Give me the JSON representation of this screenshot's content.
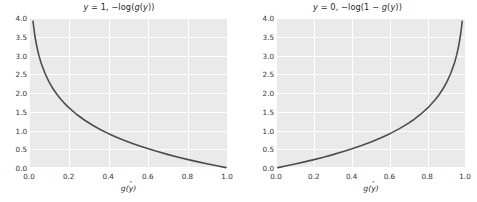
{
  "figure": {
    "width": 477,
    "height": 202,
    "background_color": "#ffffff",
    "axes_facecolor": "#eaeaea",
    "grid_color": "#ffffff",
    "curve_color": "#4d4d4d",
    "tick_color": "#333333",
    "style": "seaborn-darkgrid"
  },
  "panels": [
    {
      "id": "left",
      "title_prefix": "y",
      "title_eq": " = 1,  −log(",
      "title_fn": "g",
      "title_var": "y",
      "title_suffix": "))",
      "title_plain": "y = 1,  −log(g(ŷ))",
      "xlabel_fn": "g",
      "xlabel_var": "y",
      "xlabel_plain": "g(ŷ)",
      "xticks": [
        "0.0",
        "0.2",
        "0.4",
        "0.6",
        "0.8",
        "1.0"
      ],
      "xtick_values": [
        0.0,
        0.2,
        0.4,
        0.6,
        0.8,
        1.0
      ],
      "yticks": [
        "0.0",
        "0.5",
        "1.0",
        "1.5",
        "2.0",
        "2.5",
        "3.0",
        "3.5",
        "4.0"
      ],
      "ytick_values": [
        0.0,
        0.5,
        1.0,
        1.5,
        2.0,
        2.5,
        3.0,
        3.5,
        4.0
      ]
    },
    {
      "id": "right",
      "title_prefix": "y",
      "title_eq": " = 0,  −log(1 − ",
      "title_fn": "g",
      "title_var": "y",
      "title_suffix": "))",
      "title_plain": "y = 0,  −log(1 − g(ŷ))",
      "xlabel_fn": "g",
      "xlabel_var": "y",
      "xlabel_plain": "g(ŷ)",
      "xticks": [
        "0.0",
        "0.2",
        "0.4",
        "0.6",
        "0.8",
        "1.0"
      ],
      "xtick_values": [
        0.0,
        0.2,
        0.4,
        0.6,
        0.8,
        1.0
      ],
      "yticks": [
        "0.0",
        "0.5",
        "1.0",
        "1.5",
        "2.0",
        "2.5",
        "3.0",
        "3.5",
        "4.0"
      ],
      "ytick_values": [
        0.0,
        0.5,
        1.0,
        1.5,
        2.0,
        2.5,
        3.0,
        3.5,
        4.0
      ]
    }
  ],
  "chart_data": [
    {
      "type": "line",
      "title": "y = 1,  −log(g(ŷ))",
      "xlabel": "g(ŷ)",
      "ylabel": "",
      "xlim": [
        0.0,
        1.0
      ],
      "ylim": [
        0.0,
        4.0
      ],
      "grid": true,
      "legend": "none",
      "series": [
        {
          "name": "-log(g(yhat))",
          "x": [
            0.02,
            0.03,
            0.04,
            0.05,
            0.06,
            0.08,
            0.1,
            0.12,
            0.14,
            0.16,
            0.18,
            0.2,
            0.24,
            0.28,
            0.32,
            0.36,
            0.4,
            0.44,
            0.48,
            0.52,
            0.56,
            0.6,
            0.65,
            0.7,
            0.75,
            0.8,
            0.85,
            0.9,
            0.95,
            0.99
          ],
          "y": [
            3.912,
            3.507,
            3.219,
            2.996,
            2.813,
            2.526,
            2.303,
            2.12,
            1.966,
            1.833,
            1.715,
            1.609,
            1.427,
            1.273,
            1.139,
            1.022,
            0.916,
            0.821,
            0.734,
            0.654,
            0.58,
            0.511,
            0.431,
            0.357,
            0.288,
            0.223,
            0.163,
            0.105,
            0.051,
            0.01
          ]
        }
      ]
    },
    {
      "type": "line",
      "title": "y = 0,  −log(1 − g(ŷ))",
      "xlabel": "g(ŷ)",
      "ylabel": "",
      "xlim": [
        0.0,
        1.0
      ],
      "ylim": [
        0.0,
        4.0
      ],
      "grid": true,
      "legend": "none",
      "series": [
        {
          "name": "-log(1-g(yhat))",
          "x": [
            0.01,
            0.05,
            0.1,
            0.15,
            0.2,
            0.25,
            0.3,
            0.35,
            0.4,
            0.45,
            0.5,
            0.55,
            0.6,
            0.65,
            0.7,
            0.72,
            0.76,
            0.8,
            0.84,
            0.86,
            0.88,
            0.9,
            0.92,
            0.94,
            0.95,
            0.96,
            0.97,
            0.975,
            0.98
          ],
          "y": [
            0.01,
            0.051,
            0.105,
            0.163,
            0.223,
            0.288,
            0.357,
            0.431,
            0.511,
            0.598,
            0.693,
            0.799,
            0.916,
            1.05,
            1.204,
            1.273,
            1.427,
            1.609,
            1.833,
            1.966,
            2.12,
            2.303,
            2.526,
            2.813,
            2.996,
            3.219,
            3.507,
            3.689,
            3.912
          ]
        }
      ]
    }
  ]
}
